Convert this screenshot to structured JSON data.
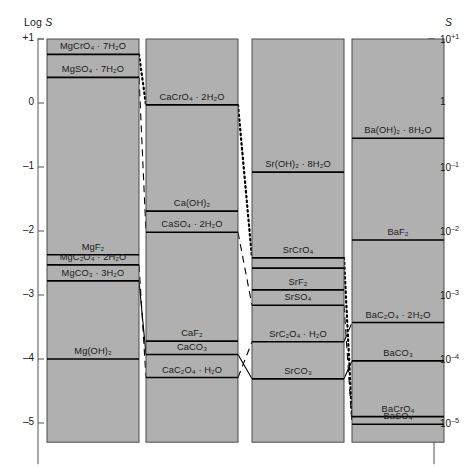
{
  "figure": {
    "left_axis_title": "Log S",
    "right_axis_title": "S",
    "fill_color": "#b0b0b0",
    "line_color": "#000000",
    "background": "#ffffff"
  },
  "axes": {
    "left": {
      "label": "Log S",
      "ticks": [
        "+1",
        "0",
        "–1",
        "–2",
        "–3",
        "–4",
        "–5"
      ],
      "values": [
        1,
        0,
        -1,
        -2,
        -3,
        -4,
        -5
      ],
      "range": [
        -5.3,
        1.0
      ]
    },
    "right": {
      "label": "S",
      "ticks_base": [
        "10",
        "1",
        "10",
        "10",
        "10",
        "10",
        "10"
      ],
      "ticks_exp": [
        "+1",
        "",
        "–1",
        "–2",
        "–3",
        "–4",
        "–5"
      ],
      "values": [
        1,
        0,
        -1,
        -2,
        -3,
        -4,
        -5
      ]
    }
  },
  "chart_data": {
    "type": "bar",
    "title": "",
    "xlabel": "",
    "ylabel": "Log S",
    "ylim": [
      -5.3,
      1.0
    ],
    "grid": false,
    "legend": "none",
    "categories": [
      "Mg",
      "Ca",
      "Sr",
      "Ba"
    ],
    "columns": [
      {
        "cation": "Mg",
        "top": 1.0,
        "bottom": -5.3,
        "boundaries": [
          0.76,
          0.4,
          -2.37,
          -2.53,
          -2.78,
          -4.0
        ],
        "bands": [
          {
            "label": "MgCrO₄ · 7H₂O",
            "top": 1.0,
            "bottom": 0.76,
            "value": 0.76
          },
          {
            "label": "MgSO₄ · 7H₂O",
            "top": 0.76,
            "bottom": 0.4,
            "value": 0.4
          },
          {
            "label": "MgF₂",
            "top": 0.4,
            "bottom": -2.37,
            "value": -2.37
          },
          {
            "label": "MgC₂O₄ · 2H₂O",
            "top": -2.37,
            "bottom": -2.78,
            "value": -2.53
          },
          {
            "label": "MgCO₃ · 3H₂O",
            "top": -2.78,
            "bottom": -4.0,
            "value": -2.78
          },
          {
            "label": "Mg(OH)₂",
            "top": -4.0,
            "bottom": -5.3,
            "value": -4.0
          }
        ]
      },
      {
        "cation": "Ca",
        "top": 1.0,
        "bottom": -5.3,
        "boundaries": [
          -0.03,
          -1.69,
          -2.02,
          -3.72,
          -3.93,
          -4.29
        ],
        "bands": [
          {
            "label": "CaCrO₄ · 2H₂O",
            "top": 1.0,
            "bottom": -0.03,
            "value": -0.03
          },
          {
            "label": "Ca(OH)₂",
            "top": -0.03,
            "bottom": -2.02,
            "value": -1.69
          },
          {
            "label": "CaSO₄ · 2H₂O",
            "top": -2.02,
            "bottom": -3.72,
            "value": -2.02
          },
          {
            "label": "CaF₂",
            "top": -3.72,
            "bottom": -3.93,
            "value": -3.72
          },
          {
            "label": "CaCO₃",
            "top": -3.93,
            "bottom": -4.29,
            "value": -3.93
          },
          {
            "label": "CaC₂O₄ · H₂O",
            "top": -4.29,
            "bottom": -5.3,
            "value": -4.29
          }
        ]
      },
      {
        "cation": "Sr",
        "top": 1.0,
        "bottom": -5.3,
        "boundaries": [
          -1.08,
          -2.42,
          -2.58,
          -2.92,
          -3.16,
          -3.73,
          -4.31
        ],
        "bands": [
          {
            "label": "Sr(OH)₂ · 8H₂O",
            "top": 1.0,
            "bottom": -1.08,
            "value": -1.08
          },
          {
            "label": "SrCrO₄",
            "top": -1.08,
            "bottom": -2.58,
            "value": -2.42
          },
          {
            "label": "SrF₂",
            "top": -2.58,
            "bottom": -2.92,
            "value": -2.92
          },
          {
            "label": "SrSO₄",
            "top": -2.92,
            "bottom": -3.16,
            "value": -3.16
          },
          {
            "label": "SrC₂O₄ · H₂O",
            "top": -3.16,
            "bottom": -3.73,
            "value": -3.73
          },
          {
            "label": "SrCO₃",
            "top": -3.73,
            "bottom": -5.3,
            "value": -4.31
          }
        ]
      },
      {
        "cation": "Ba",
        "top": 1.0,
        "bottom": -5.3,
        "boundaries": [
          -0.55,
          -2.14,
          -3.43,
          -4.03,
          -4.9,
          -5.02
        ],
        "bands": [
          {
            "label": "Ba(OH)₂ · 8H₂O",
            "top": 1.0,
            "bottom": -0.55,
            "value": -0.55
          },
          {
            "label": "BaF₂",
            "top": -0.55,
            "bottom": -2.14,
            "value": -2.14
          },
          {
            "label": "BaC₂O₄ · 2H₂O",
            "top": -2.14,
            "bottom": -3.43,
            "value": -3.43
          },
          {
            "label": "BaCO₃",
            "top": -3.43,
            "bottom": -4.03,
            "value": -4.03
          },
          {
            "label": "BaCrO₄",
            "top": -4.03,
            "bottom": -4.9,
            "value": -4.9
          },
          {
            "label": "BaSO₄",
            "top": -4.9,
            "bottom": -5.3,
            "value": -5.02
          }
        ]
      }
    ],
    "connectors": [
      {
        "anion": "chromate",
        "style": "dotted",
        "points": [
          [
            0,
            0.76
          ],
          [
            1,
            -0.03
          ],
          [
            2,
            -2.42
          ],
          [
            3,
            -4.9
          ]
        ]
      },
      {
        "anion": "sulfate",
        "style": "dashed",
        "points": [
          [
            0,
            0.4
          ],
          [
            1,
            -2.02
          ],
          [
            2,
            -3.16
          ],
          [
            3,
            -5.02
          ]
        ]
      },
      {
        "anion": "oxalate",
        "style": "dashed",
        "points": [
          [
            0,
            -2.53
          ],
          [
            1,
            -4.29
          ],
          [
            2,
            -3.73
          ],
          [
            3,
            -3.43
          ]
        ]
      },
      {
        "anion": "carbonate",
        "style": "solid",
        "points": [
          [
            0,
            -2.78
          ],
          [
            1,
            -3.93
          ],
          [
            2,
            -4.31
          ],
          [
            3,
            -4.03
          ]
        ]
      }
    ]
  }
}
